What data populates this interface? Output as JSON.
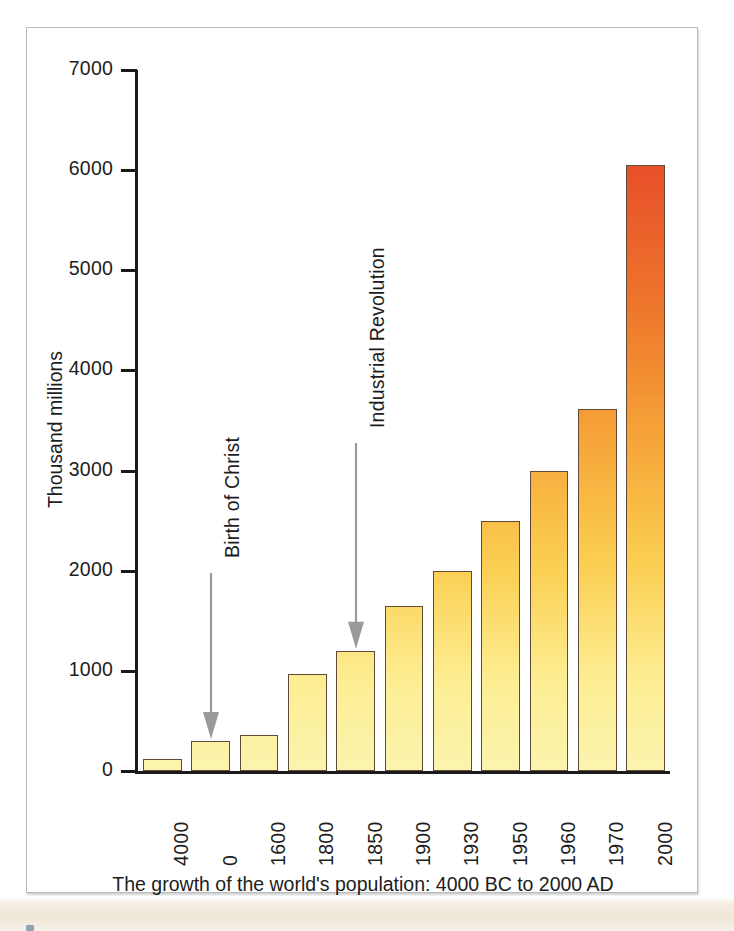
{
  "chart_data": {
    "type": "bar",
    "title": "",
    "caption": "The growth of the world's population: 4000 BC to 2000 AD",
    "xlabel": "",
    "ylabel": "Thousand millions",
    "categories": [
      "4000",
      "0",
      "1600",
      "1800",
      "1850",
      "1900",
      "1930",
      "1950",
      "1960",
      "1970",
      "2000"
    ],
    "values": [
      120,
      300,
      360,
      970,
      1200,
      1650,
      2000,
      2500,
      3000,
      3610,
      6050
    ],
    "ylim": [
      0,
      7000
    ],
    "y_ticks": [
      "0",
      "1000",
      "2000",
      "3000",
      "4000",
      "5000",
      "6000",
      "7000"
    ],
    "y_tick_values": [
      0,
      1000,
      2000,
      3000,
      4000,
      5000,
      6000,
      7000
    ],
    "grid": false,
    "legend": "none",
    "annotations": [
      {
        "text": "Birth of Christ",
        "points_to_category": "0"
      },
      {
        "text": "Industrial Revolution",
        "points_to_category": "1850"
      }
    ],
    "colors": {
      "bar_gradient_top": "#E2431F",
      "bar_gradient_mid": "#F6A93A",
      "bar_gradient_bottom": "#FBF4AE",
      "bar_outline": "#5D4A3A",
      "axis": "#1A1A1A",
      "text": "#1D1D1D",
      "arrow": "#9A9A9A",
      "frame_border": "#B9BCBE",
      "page_strip": "#EFE7D8"
    }
  },
  "figure": {
    "y_axis_title": "Thousand millions",
    "caption": "The growth of the world's population: 4000 BC to 2000 AD",
    "annotation_birth": "Birth of Christ",
    "annotation_industrial": "Industrial Revolution"
  }
}
